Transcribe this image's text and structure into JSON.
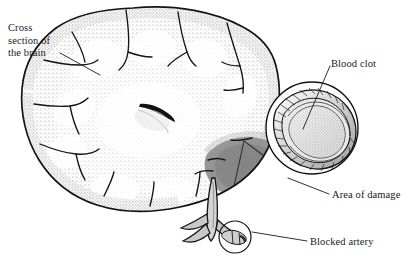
{
  "figure": {
    "type": "medical-illustration",
    "background_color": "#ffffff",
    "ink_color": "#1a1a1a",
    "width": 416,
    "height": 264
  },
  "labels": {
    "cross_section": "Cross\nsection of\nthe brain",
    "blood_clot": "Blood clot",
    "area_of_damage": "Area of damage",
    "blocked_artery": "Blocked artery"
  },
  "parts": {
    "brain_name": "brain-cross-section",
    "ventricle_name": "ventricle",
    "damage_name": "area-of-damage-shading",
    "artery_name": "artery-branches",
    "brainstem_name": "brainstem",
    "marker_circle_name": "blocked-artery-marker",
    "inset_name": "artery-magnification-inset",
    "clot_name": "blood-clot"
  },
  "colors": {
    "cortex_stipple": "#9a9a9a",
    "damage_gray": "#8d8d8d",
    "damage_gray_dark": "#7a7a7a",
    "outline": "#141414",
    "clot_fill": "#d8d8d8",
    "vessel_wall": "#bdbdbd"
  }
}
